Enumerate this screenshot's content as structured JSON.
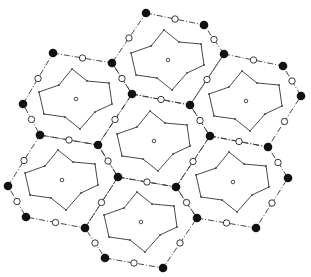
{
  "diagram": {
    "colors": {
      "line": "#333333",
      "black_node": "#111111",
      "open_node_fill": "#ffffff",
      "background": "#ffffff"
    },
    "black_node_radius": 4.3,
    "open_node_radius": 3.2,
    "center_dot_radius": 1.8,
    "inner_vertex_radius": 0.9,
    "inner_shape_offsets": [
      [
        -4,
        -30
      ],
      [
        11,
        -18
      ],
      [
        33,
        -16
      ],
      [
        36,
        5
      ],
      [
        19,
        13
      ],
      [
        4,
        30
      ],
      [
        -11,
        18
      ],
      [
        -32,
        15
      ],
      [
        -37,
        -7
      ],
      [
        -17,
        -14
      ]
    ],
    "cells": [
      {
        "name": "top",
        "center": [
          168,
          60
        ],
        "hex": [
          [
            146,
            13
          ],
          [
            204,
            25
          ],
          [
            224,
            54
          ],
          [
            190,
            105
          ],
          [
            132,
            94
          ],
          [
            112,
            63
          ]
        ]
      },
      {
        "name": "upper-left",
        "center": [
          76,
          99
        ],
        "hex": [
          [
            53,
            53
          ],
          [
            112,
            63
          ],
          [
            132,
            94
          ],
          [
            98,
            145
          ],
          [
            40,
            135
          ],
          [
            23,
            104
          ]
        ]
      },
      {
        "name": "upper-right",
        "center": [
          246,
          101
        ],
        "hex": [
          [
            224,
            54
          ],
          [
            283,
            66
          ],
          [
            301,
            96
          ],
          [
            268,
            147
          ],
          [
            210,
            136
          ],
          [
            190,
            105
          ]
        ]
      },
      {
        "name": "middle",
        "center": [
          154,
          141
        ],
        "hex": [
          [
            132,
            94
          ],
          [
            190,
            105
          ],
          [
            210,
            136
          ],
          [
            176,
            187
          ],
          [
            118,
            177
          ],
          [
            98,
            145
          ]
        ]
      },
      {
        "name": "lower-left",
        "center": [
          62,
          180
        ],
        "hex": [
          [
            40,
            135
          ],
          [
            98,
            145
          ],
          [
            118,
            177
          ],
          [
            85,
            228
          ],
          [
            26,
            217
          ],
          [
            8,
            186
          ]
        ]
      },
      {
        "name": "lower-right",
        "center": [
          233,
          182
        ],
        "hex": [
          [
            210,
            136
          ],
          [
            268,
            147
          ],
          [
            288,
            178
          ],
          [
            256,
            228
          ],
          [
            197,
            218
          ],
          [
            176,
            187
          ]
        ]
      },
      {
        "name": "bottom",
        "center": [
          141,
          222
        ],
        "hex": [
          [
            118,
            177
          ],
          [
            176,
            187
          ],
          [
            197,
            218
          ],
          [
            163,
            268
          ],
          [
            105,
            258
          ],
          [
            85,
            228
          ]
        ]
      }
    ]
  }
}
